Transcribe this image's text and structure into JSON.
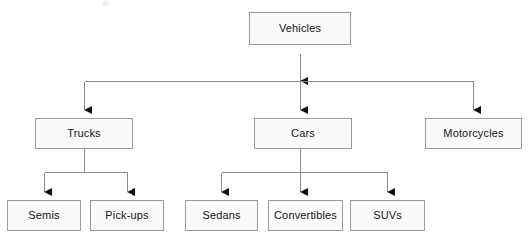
{
  "diagram": {
    "type": "hierarchy-tree",
    "orientation": "top-down",
    "style": {
      "background_color": "#ffffff",
      "box_fill_color": "#fafafa",
      "box_border_color": "#9a9a9a",
      "connector_color": "#8c8c8c",
      "arrowhead_color": "#111111",
      "text_color": "#141414"
    },
    "nodes": [
      {
        "id": "vehicles",
        "label": "Vehicles",
        "level": 1,
        "x": 249,
        "y": 12,
        "w": 102,
        "h": 33
      },
      {
        "id": "trucks",
        "label": "Trucks",
        "level": 2,
        "x": 35,
        "y": 118,
        "w": 98,
        "h": 31
      },
      {
        "id": "cars",
        "label": "Cars",
        "level": 2,
        "x": 254,
        "y": 118,
        "w": 98,
        "h": 31
      },
      {
        "id": "motorcycles",
        "label": "Motorcycles",
        "level": 2,
        "x": 425,
        "y": 118,
        "w": 97,
        "h": 31
      },
      {
        "id": "semis",
        "label": "Semis",
        "level": 3,
        "x": 7,
        "y": 200,
        "w": 74,
        "h": 31
      },
      {
        "id": "pickups",
        "label": "Pick-ups",
        "level": 3,
        "x": 90,
        "y": 200,
        "w": 74,
        "h": 31
      },
      {
        "id": "sedans",
        "label": "Sedans",
        "level": 3,
        "x": 185,
        "y": 200,
        "w": 73,
        "h": 31
      },
      {
        "id": "convertibles",
        "label": "Convertibles",
        "level": 3,
        "x": 268,
        "y": 200,
        "w": 75,
        "h": 31
      },
      {
        "id": "suvs",
        "label": "SUVs",
        "level": 3,
        "x": 350,
        "y": 200,
        "w": 75,
        "h": 31
      }
    ],
    "edges": [
      {
        "from": "trucks",
        "to": "vehicles",
        "direction": "up",
        "arrow_at": "vehicles"
      },
      {
        "from": "cars",
        "to": "vehicles",
        "direction": "up",
        "arrow_at": "vehicles"
      },
      {
        "from": "motorcycles",
        "to": "vehicles",
        "direction": "up",
        "arrow_at": "vehicles"
      },
      {
        "from": "vehicles",
        "to": "trucks",
        "direction": "down",
        "arrow_at": "trucks"
      },
      {
        "from": "vehicles",
        "to": "cars",
        "direction": "down",
        "arrow_at": "cars"
      },
      {
        "from": "vehicles",
        "to": "motorcycles",
        "direction": "down",
        "arrow_at": "motorcycles"
      },
      {
        "from": "trucks",
        "to": "semis",
        "direction": "down",
        "arrow_at": "semis"
      },
      {
        "from": "trucks",
        "to": "pickups",
        "direction": "down",
        "arrow_at": "pickups"
      },
      {
        "from": "cars",
        "to": "sedans",
        "direction": "down",
        "arrow_at": "sedans"
      },
      {
        "from": "cars",
        "to": "convertibles",
        "direction": "down",
        "arrow_at": "convertibles"
      },
      {
        "from": "cars",
        "to": "suvs",
        "direction": "down",
        "arrow_at": "suvs"
      }
    ]
  }
}
